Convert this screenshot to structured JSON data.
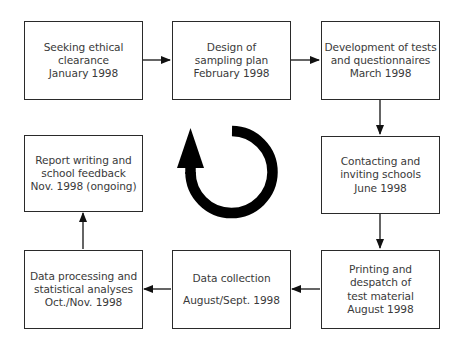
{
  "diagram": {
    "type": "cyclical process flowchart",
    "steps": [
      {
        "id": "s1",
        "lines": [
          "Seeking ethical",
          "clearance",
          "January 1998"
        ]
      },
      {
        "id": "s2",
        "lines": [
          "Design of",
          "sampling plan",
          "February 1998"
        ]
      },
      {
        "id": "s3",
        "lines": [
          "Development of tests",
          "and questionnaires",
          "March 1998"
        ]
      },
      {
        "id": "s4",
        "lines": [
          "Contacting and",
          "inviting schools",
          "June 1998"
        ]
      },
      {
        "id": "s5",
        "lines": [
          "Printing and",
          "despatch of",
          "test material",
          "August 1998"
        ]
      },
      {
        "id": "s6",
        "lines": [
          "Data collection",
          "August/Sept. 1998"
        ]
      },
      {
        "id": "s7",
        "lines": [
          "Data processing and",
          "statistical analyses",
          "Oct./Nov. 1998"
        ]
      },
      {
        "id": "s8",
        "lines": [
          "Report writing and",
          "school feedback",
          "Nov. 1998 (ongoing)"
        ]
      }
    ],
    "connections": [
      {
        "from": "s1",
        "to": "s2",
        "direction": "right"
      },
      {
        "from": "s2",
        "to": "s3",
        "direction": "right"
      },
      {
        "from": "s3",
        "to": "s4",
        "direction": "down"
      },
      {
        "from": "s4",
        "to": "s5",
        "direction": "down"
      },
      {
        "from": "s5",
        "to": "s6",
        "direction": "left"
      },
      {
        "from": "s6",
        "to": "s7",
        "direction": "left"
      },
      {
        "from": "s7",
        "to": "s8",
        "direction": "up"
      }
    ],
    "center_icon": "cycle-arrow-icon",
    "colors": {
      "stroke": "#2a2a2a",
      "text": "#3a3a3a",
      "icon": "#000000",
      "background": "#ffffff"
    }
  }
}
